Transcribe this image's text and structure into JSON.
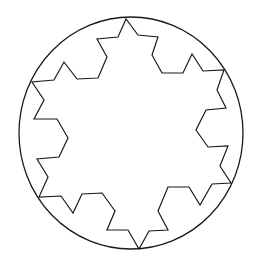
{
  "figure": {
    "stroke_color": "#1a1a1a",
    "background": "#ffffff",
    "circle": {
      "cx": 131,
      "cy": 133,
      "rx": 112,
      "ry": 116
    },
    "snowflake_points": "126,19 118,37 97,39 107,57 98,78 77,79 64,62 54,80 32,82 44,100 34,119 57,119 68,138 59,157 37,159 48,177 39,197 61,196 73,213 82,194 102,193 115,211 107,230 128,230 139,249 149,231 168,230 158,211 168,187 189,187 200,205 212,184 231,183 220,166 228,146 208,147 196,130 206,110 226,108 217,90 224,70 203,71 192,54 183,73 162,73 152,55 158,37 138,35"
  }
}
